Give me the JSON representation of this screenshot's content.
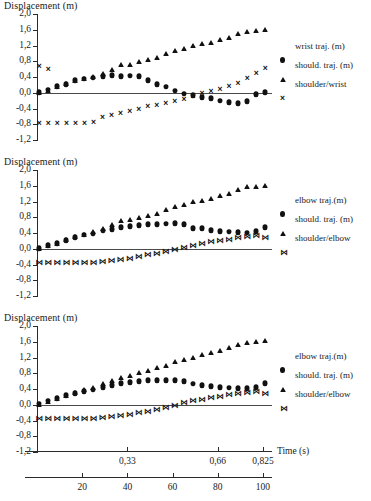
{
  "figure": {
    "ytitle": "Displacement (m)",
    "time_title": "Time (s)"
  },
  "chart_data": [
    {
      "type": "scatter",
      "title": "Displacement (m)",
      "xlabel": "Time (s)",
      "ylabel": "Displacement (m)",
      "ylim": [
        -1.2,
        2.0
      ],
      "yticks": [
        "2,0",
        "1,6",
        "1,2",
        "0,8",
        "0,4",
        "0,0",
        "-0,4",
        "-0,8",
        "-1,2"
      ],
      "ytick_values": [
        2.0,
        1.6,
        1.2,
        0.8,
        0.4,
        0.0,
        -0.4,
        -0.8,
        -1.2
      ],
      "xlim": [
        0,
        104
      ],
      "grid": false,
      "legend_position": "right",
      "series": [
        {
          "name": "wrist traj. (m)",
          "marker": "circle",
          "x": [
            1,
            5,
            9,
            13,
            17,
            21,
            25,
            29,
            33,
            37,
            41,
            45,
            49,
            53,
            57,
            61,
            65,
            69,
            73,
            77,
            81,
            85,
            89,
            93,
            97,
            101
          ],
          "values": [
            0.02,
            0.08,
            0.16,
            0.22,
            0.32,
            0.36,
            0.38,
            0.42,
            0.45,
            0.42,
            0.43,
            0.42,
            0.32,
            0.22,
            0.15,
            0.05,
            -0.02,
            -0.06,
            -0.12,
            -0.14,
            -0.2,
            -0.24,
            -0.26,
            -0.22,
            -0.04,
            0.02
          ]
        },
        {
          "name": "should. traj. (m)",
          "marker": "triangle",
          "x": [
            1,
            5,
            9,
            13,
            17,
            21,
            25,
            29,
            33,
            37,
            41,
            45,
            49,
            53,
            57,
            61,
            65,
            69,
            73,
            77,
            81,
            85,
            89,
            93,
            97,
            101
          ],
          "values": [
            0.02,
            0.08,
            0.16,
            0.24,
            0.33,
            0.38,
            0.42,
            0.5,
            0.6,
            0.72,
            0.74,
            0.8,
            0.86,
            0.92,
            1.0,
            1.08,
            1.14,
            1.22,
            1.26,
            1.3,
            1.36,
            1.42,
            1.52,
            1.58,
            1.6,
            1.63
          ]
        },
        {
          "name": "shoulder/wrist",
          "marker": "cross",
          "x": [
            1,
            5,
            9,
            13,
            17,
            21,
            25,
            29,
            33,
            37,
            41,
            45,
            49,
            53,
            57,
            61,
            65,
            69,
            73,
            77,
            81,
            85,
            89,
            93,
            97,
            101
          ],
          "values": [
            -0.76,
            -0.76,
            -0.76,
            -0.76,
            -0.76,
            -0.76,
            -0.74,
            -0.62,
            -0.56,
            -0.52,
            -0.46,
            -0.42,
            -0.34,
            -0.3,
            -0.26,
            -0.2,
            -0.16,
            -0.08,
            0.0,
            0.04,
            0.1,
            0.16,
            0.26,
            0.38,
            0.5,
            0.62,
            0.68,
            0.6
          ]
        }
      ]
    },
    {
      "type": "scatter",
      "title": "Displacement (m)",
      "xlabel": "Time (s)",
      "ylabel": "Displacement (m)",
      "ylim": [
        -1.2,
        2.0
      ],
      "yticks": [
        "2,0",
        "1,6",
        "1,2",
        "0,8",
        "0,4",
        "0,0",
        "-0,4",
        "-0,8",
        "-1,2"
      ],
      "ytick_values": [
        2.0,
        1.6,
        1.2,
        0.8,
        0.4,
        0.0,
        -0.4,
        -0.8,
        -1.2
      ],
      "xlim": [
        0,
        104
      ],
      "grid": false,
      "legend_position": "right",
      "series": [
        {
          "name": "elbow traj.(m)",
          "marker": "circle",
          "x": [
            1,
            5,
            9,
            13,
            17,
            21,
            25,
            29,
            33,
            37,
            41,
            45,
            49,
            53,
            57,
            61,
            65,
            69,
            73,
            77,
            81,
            85,
            89,
            93,
            97,
            101
          ],
          "values": [
            0.02,
            0.09,
            0.14,
            0.22,
            0.3,
            0.36,
            0.38,
            0.46,
            0.5,
            0.55,
            0.58,
            0.6,
            0.62,
            0.62,
            0.64,
            0.65,
            0.62,
            0.52,
            0.52,
            0.47,
            0.44,
            0.43,
            0.42,
            0.41,
            0.44,
            0.55
          ]
        },
        {
          "name": "should. traj. (m)",
          "marker": "triangle",
          "x": [
            1,
            5,
            9,
            13,
            17,
            21,
            25,
            29,
            33,
            37,
            41,
            45,
            49,
            53,
            57,
            61,
            65,
            69,
            73,
            77,
            81,
            85,
            89,
            93,
            97,
            101
          ],
          "values": [
            0.02,
            0.09,
            0.15,
            0.24,
            0.33,
            0.38,
            0.44,
            0.53,
            0.62,
            0.72,
            0.76,
            0.8,
            0.85,
            0.9,
            1.0,
            1.08,
            1.14,
            1.22,
            1.25,
            1.3,
            1.36,
            1.42,
            1.52,
            1.6,
            1.6,
            1.63
          ]
        },
        {
          "name": "shoulder/elbow",
          "marker": "bowtie",
          "x": [
            1,
            5,
            9,
            13,
            17,
            21,
            25,
            29,
            33,
            37,
            41,
            45,
            49,
            53,
            57,
            61,
            65,
            69,
            73,
            77,
            81,
            85,
            89,
            93,
            97,
            101
          ],
          "values": [
            -0.35,
            -0.35,
            -0.35,
            -0.35,
            -0.35,
            -0.35,
            -0.35,
            -0.33,
            -0.3,
            -0.28,
            -0.26,
            -0.22,
            -0.17,
            -0.13,
            -0.08,
            -0.03,
            0.03,
            0.08,
            0.12,
            0.16,
            0.19,
            0.22,
            0.27,
            0.3,
            0.32,
            0.28
          ]
        }
      ]
    },
    {
      "type": "scatter",
      "title": "Displacement (m)",
      "xlabel": "Time (s)",
      "ylabel": "Displacement (m)",
      "ylim": [
        -1.2,
        2.0
      ],
      "yticks": [
        "2,0",
        "1,6",
        "1,2",
        "0,8",
        "0,4",
        "0,0",
        "-0,4",
        "-0,8",
        "-1,2"
      ],
      "ytick_values": [
        2.0,
        1.6,
        1.2,
        0.8,
        0.4,
        0.0,
        -0.4,
        -0.8,
        -1.2
      ],
      "xlim": [
        0,
        104
      ],
      "grid": false,
      "legend_position": "right",
      "series": [
        {
          "name": "elbow traj.(m)",
          "marker": "circle",
          "x": [
            1,
            5,
            9,
            13,
            17,
            21,
            25,
            29,
            33,
            37,
            41,
            45,
            49,
            53,
            57,
            61,
            65,
            69,
            73,
            77,
            81,
            85,
            89,
            93,
            97,
            101
          ],
          "values": [
            0.03,
            0.1,
            0.16,
            0.24,
            0.3,
            0.35,
            0.38,
            0.44,
            0.5,
            0.55,
            0.58,
            0.6,
            0.62,
            0.62,
            0.63,
            0.62,
            0.6,
            0.53,
            0.5,
            0.47,
            0.45,
            0.43,
            0.42,
            0.42,
            0.45,
            0.55
          ]
        },
        {
          "name": "should. traj. (m)",
          "marker": "triangle",
          "x": [
            1,
            5,
            9,
            13,
            17,
            21,
            25,
            29,
            33,
            37,
            41,
            45,
            49,
            53,
            57,
            61,
            65,
            69,
            73,
            77,
            81,
            85,
            89,
            93,
            97,
            101
          ],
          "values": [
            0.03,
            0.1,
            0.17,
            0.25,
            0.33,
            0.39,
            0.45,
            0.54,
            0.62,
            0.7,
            0.76,
            0.82,
            0.88,
            0.95,
            1.02,
            1.1,
            1.16,
            1.22,
            1.28,
            1.34,
            1.4,
            1.47,
            1.54,
            1.6,
            1.62,
            1.64
          ]
        },
        {
          "name": "shoulder/elbow",
          "marker": "bowtie",
          "x": [
            1,
            5,
            9,
            13,
            17,
            21,
            25,
            29,
            33,
            37,
            41,
            45,
            49,
            53,
            57,
            61,
            65,
            69,
            73,
            77,
            81,
            85,
            89,
            93,
            97,
            101
          ],
          "values": [
            -0.36,
            -0.36,
            -0.36,
            -0.36,
            -0.36,
            -0.36,
            -0.35,
            -0.33,
            -0.3,
            -0.28,
            -0.25,
            -0.22,
            -0.18,
            -0.13,
            -0.08,
            -0.02,
            0.04,
            0.09,
            0.13,
            0.17,
            0.2,
            0.24,
            0.28,
            0.3,
            0.33,
            0.28
          ]
        }
      ]
    }
  ],
  "time_axis": {
    "seconds_labels": [
      "0,33",
      "0,66",
      "0,825"
    ],
    "seconds_values": [
      0.33,
      0.66,
      0.825
    ],
    "seconds_max": 0.825,
    "frames_labels": [
      "20",
      "40",
      "60",
      "80",
      "100"
    ],
    "frames_values": [
      20,
      40,
      60,
      80,
      100
    ],
    "frames_max": 104
  }
}
